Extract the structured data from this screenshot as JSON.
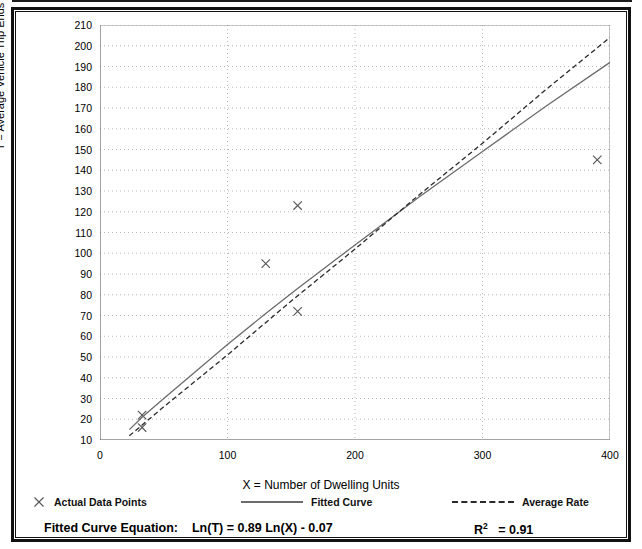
{
  "chart_data": {
    "type": "scatter",
    "title": "",
    "xlabel": "X = Number of Dwelling Units",
    "ylabel": "T = Average Vehicle Trip Ends",
    "xlim": [
      0,
      400
    ],
    "ylim": [
      10,
      210
    ],
    "xticks": [
      0,
      100,
      200,
      300,
      400
    ],
    "xtick_labels": [
      "0",
      "100",
      "200",
      "300",
      "400"
    ],
    "xminor_step": 50,
    "yticks": [
      10,
      20,
      30,
      40,
      50,
      60,
      70,
      80,
      90,
      100,
      110,
      120,
      130,
      140,
      150,
      160,
      170,
      180,
      190,
      200,
      210
    ],
    "ytick_labels": [
      "10",
      "20",
      "30",
      "40",
      "50",
      "60",
      "70",
      "80",
      "90",
      "100",
      "110",
      "120",
      "130",
      "140",
      "150",
      "160",
      "170",
      "180",
      "190",
      "200",
      "210"
    ],
    "yminor_step": 5,
    "grid": true,
    "grid_style": "dotted",
    "grid_color": "#b9b9b9",
    "legend_position": "below-axes",
    "series": [
      {
        "name": "Actual Data Points",
        "type": "scatter",
        "marker": "x",
        "color": "#555555",
        "points": [
          {
            "x": 33,
            "y": 22
          },
          {
            "x": 33,
            "y": 16
          },
          {
            "x": 130,
            "y": 95
          },
          {
            "x": 155,
            "y": 123
          },
          {
            "x": 155,
            "y": 72
          },
          {
            "x": 390,
            "y": 145
          }
        ]
      },
      {
        "name": "Fitted Curve",
        "type": "line",
        "style": "solid",
        "color": "#6b6b6b",
        "equation": "Ln(T) = 0.89 Ln(X) - 0.07",
        "slope_ln": 0.89,
        "intercept_ln": -0.07,
        "points": [
          {
            "x": 23,
            "y": 15
          },
          {
            "x": 33,
            "y": 21
          },
          {
            "x": 50,
            "y": 30
          },
          {
            "x": 75,
            "y": 43
          },
          {
            "x": 100,
            "y": 56
          },
          {
            "x": 130,
            "y": 71
          },
          {
            "x": 155,
            "y": 83
          },
          {
            "x": 200,
            "y": 104
          },
          {
            "x": 250,
            "y": 127
          },
          {
            "x": 300,
            "y": 149
          },
          {
            "x": 350,
            "y": 171
          },
          {
            "x": 400,
            "y": 192
          }
        ]
      },
      {
        "name": "Average Rate",
        "type": "line",
        "style": "dashed",
        "color": "#2a2a2a",
        "points": [
          {
            "x": 23,
            "y": 12
          },
          {
            "x": 50,
            "y": 26
          },
          {
            "x": 100,
            "y": 51
          },
          {
            "x": 150,
            "y": 77
          },
          {
            "x": 200,
            "y": 102
          },
          {
            "x": 250,
            "y": 128
          },
          {
            "x": 300,
            "y": 153
          },
          {
            "x": 350,
            "y": 179
          },
          {
            "x": 400,
            "y": 204
          }
        ]
      }
    ]
  },
  "axis": {
    "y_title": "T = Average Vehicle Trip Ends",
    "x_title": "X = Number of Dwelling Units"
  },
  "legend": {
    "items": [
      {
        "label": "Actual Data Points",
        "glyph": "x-marker-icon"
      },
      {
        "label": "Fitted Curve",
        "glyph": "solid-line-icon"
      },
      {
        "label": "Average Rate",
        "glyph": "dashed-line-icon"
      }
    ]
  },
  "footer": {
    "equation_label": "Fitted Curve Equation:",
    "equation": "Ln(T) = 0.89 Ln(X) - 0.07",
    "r_squared_symbol": "R",
    "r_squared_exponent": "2",
    "r_squared_value": "= 0.91"
  }
}
